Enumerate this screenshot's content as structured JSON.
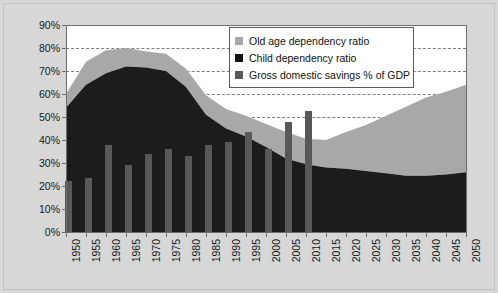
{
  "chart_data": {
    "type": "area",
    "title": "",
    "xlabel": "",
    "ylabel": "",
    "ylim": [
      0,
      90
    ],
    "ytick_labels": [
      "0%",
      "10%",
      "20%",
      "30%",
      "40%",
      "50%",
      "60%",
      "70%",
      "80%",
      "90%"
    ],
    "ytick_values": [
      0,
      10,
      20,
      30,
      40,
      50,
      60,
      70,
      80,
      90
    ],
    "grid": true,
    "legend_position": "upper-center-right",
    "categories": [
      1950,
      1955,
      1960,
      1965,
      1970,
      1975,
      1980,
      1985,
      1990,
      1995,
      2000,
      2005,
      2010,
      2015,
      2020,
      2025,
      2030,
      2035,
      2040,
      2045,
      2050
    ],
    "xtick_labels": [
      "1950",
      "1955",
      "1960",
      "1965",
      "1970",
      "1975",
      "1980",
      "1985",
      "1990",
      "1995",
      "2000",
      "2005",
      "2010",
      "2015",
      "2020",
      "2025",
      "2030",
      "2035",
      "2040",
      "2045",
      "2050"
    ],
    "series": [
      {
        "name": "Child dependency ratio",
        "type": "area-stacked",
        "color": "#1c1c1c",
        "values": [
          54,
          64,
          69,
          72,
          71.5,
          70,
          63,
          51,
          45,
          41.5,
          37,
          32,
          29.5,
          28,
          27.5,
          26.5,
          25.5,
          24.5,
          24.5,
          25,
          26
        ]
      },
      {
        "name": "Old age dependency ratio",
        "type": "area-stacked",
        "color": "#a8a8a8",
        "values": [
          6,
          10,
          10,
          8,
          7,
          7.5,
          8,
          8.5,
          8.5,
          9,
          10,
          11.5,
          11,
          12,
          16,
          20,
          25,
          30,
          34,
          36,
          38
        ]
      },
      {
        "name": "Gross domestic savings % of GDP",
        "type": "bar",
        "color": "#585858",
        "x": [
          1950,
          1955,
          1960,
          1965,
          1970,
          1975,
          1980,
          1985,
          1990,
          1995,
          2000,
          2005,
          2010
        ],
        "values": [
          22,
          23.5,
          38,
          29,
          34,
          36,
          33,
          38,
          39,
          43.5,
          36,
          48,
          52.5
        ]
      }
    ],
    "legend": [
      {
        "label": "Old age dependency ratio",
        "color": "#a8a8a8"
      },
      {
        "label": "Child dependency ratio",
        "color": "#111111"
      },
      {
        "label": "Gross domestic savings % of GDP",
        "color": "#585858"
      }
    ]
  }
}
